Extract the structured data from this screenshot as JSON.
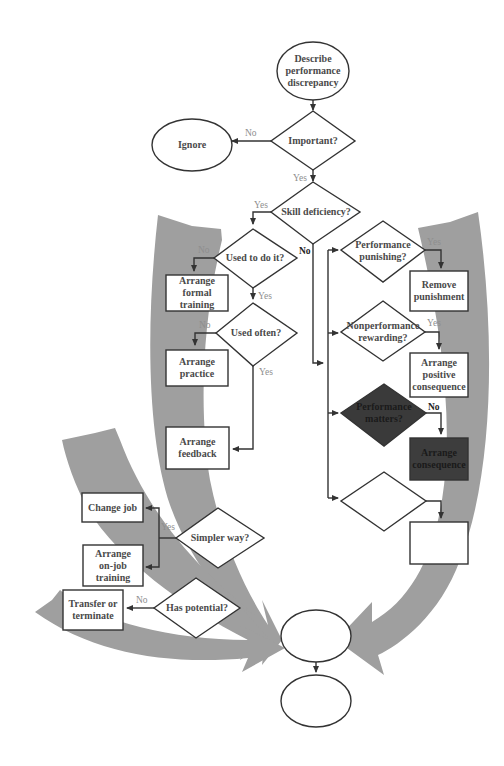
{
  "diagram": {
    "type": "flowchart",
    "colors": {
      "background": "#ffffff",
      "swoosh_gray": "#9a9a9a",
      "stroke": "#333333",
      "text": "#4a4a4a",
      "edge_label": "#8e8e8e",
      "dark_fill_diamond": "#3a3a3a",
      "dark_fill_box": "#3d3d3d"
    },
    "nodes": {
      "start": {
        "shape": "ellipse",
        "text": "Describe\nperformance\ndiscrepancy"
      },
      "ignore": {
        "shape": "ellipse",
        "text": "Ignore"
      },
      "important": {
        "shape": "diamond",
        "text": "Important?"
      },
      "skill_deficiency": {
        "shape": "diamond",
        "text": "Skill deficiency?"
      },
      "used_to_do_it": {
        "shape": "diamond",
        "text": "Used to do it?"
      },
      "arrange_formal_training": {
        "shape": "box",
        "text": "Arrange\nformal\ntraining"
      },
      "used_often": {
        "shape": "diamond",
        "text": "Used often?"
      },
      "arrange_practice": {
        "shape": "box",
        "text": "Arrange\npractice"
      },
      "arrange_feedback": {
        "shape": "box",
        "text": "Arrange\nfeedback"
      },
      "performance_punishing": {
        "shape": "diamond",
        "text": "Performance\npunishing?"
      },
      "remove_punishment": {
        "shape": "box",
        "text": "Remove\npunishment"
      },
      "nonperformance_rewarding": {
        "shape": "diamond",
        "text": "Nonperformance\nrewarding?"
      },
      "arrange_positive_consequence": {
        "shape": "box",
        "text": "Arrange\npositive\nconsequence"
      },
      "performance_matters": {
        "shape": "diamond",
        "text": "Performance\nmatters?",
        "filled": true
      },
      "arrange_consequence": {
        "shape": "box",
        "text": "Arrange\nconsequence",
        "filled": true
      },
      "blank_diamond": {
        "shape": "diamond",
        "text": ""
      },
      "blank_box": {
        "shape": "box",
        "text": ""
      },
      "change_job": {
        "shape": "box",
        "text": "Change job"
      },
      "simpler_way": {
        "shape": "diamond",
        "text": "Simpler way?"
      },
      "arrange_on_job_training": {
        "shape": "box",
        "text": "Arrange\non-job\ntraining"
      },
      "transfer_or_terminate": {
        "shape": "box",
        "text": "Transfer or\nterminate"
      },
      "has_potential": {
        "shape": "diamond",
        "text": "Has potential?"
      },
      "blank_ellipse_1": {
        "shape": "ellipse",
        "text": ""
      },
      "blank_ellipse_2": {
        "shape": "ellipse",
        "text": ""
      }
    },
    "edge_labels": {
      "important_no": "No",
      "important_yes": "Yes",
      "skill_yes": "Yes",
      "skill_no": "No",
      "used_to_do_no": "No",
      "used_to_do_yes": "Yes",
      "used_often_no": "No",
      "used_often_yes": "Yes",
      "punishing_yes": "Yes",
      "rewarding_yes": "Yes",
      "matters_no": "No",
      "simpler_yes": "Yes",
      "potential_no": "No"
    }
  }
}
